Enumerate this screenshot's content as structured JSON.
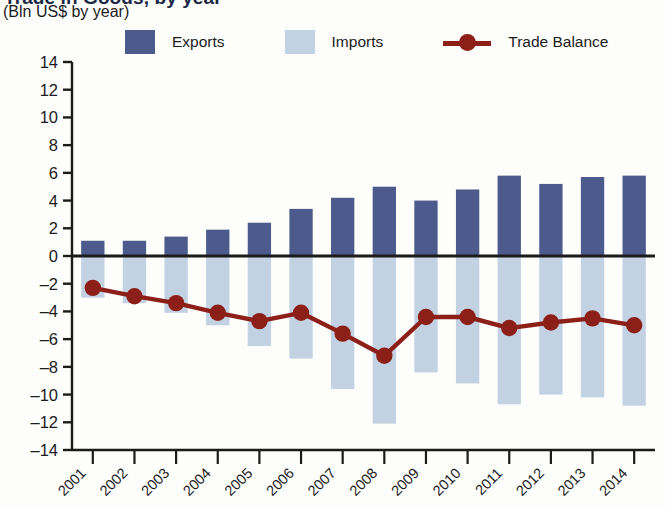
{
  "header": {
    "title": "Trade in Goods, by year",
    "subtitle": "(Bln US$ by year)"
  },
  "legend": {
    "items": [
      {
        "label": "Exports",
        "type": "swatch",
        "color": "#4c5b8c",
        "name": "legend-exports"
      },
      {
        "label": "Imports",
        "type": "swatch",
        "color": "#c3d2e3",
        "name": "legend-imports"
      },
      {
        "label": "Trade Balance",
        "type": "line",
        "color": "#8c1f17",
        "name": "legend-trade-balance"
      }
    ]
  },
  "axes": {
    "y_ticks": [
      "14",
      "12",
      "10",
      "8",
      "6",
      "4",
      "2",
      "0",
      "-2",
      "-4",
      "-6",
      "-8",
      "-10",
      "-12",
      "-14"
    ],
    "y_min": -14,
    "y_max": 14,
    "y_step": 2,
    "x_labels": [
      "2001",
      "2002",
      "2003",
      "2004",
      "2005",
      "2006",
      "2007",
      "2008",
      "2009",
      "2010",
      "2011",
      "2012",
      "2013",
      "2014"
    ]
  },
  "colors": {
    "exports": "#4c5b8c",
    "imports": "#c3d2e3",
    "trade_balance": "#8c1f17",
    "axis": "#1b1b1b"
  },
  "chart_data": {
    "type": "bar",
    "title": "Trade in Goods, by year",
    "subtitle": "(Bln US$ by year)",
    "xlabel": "",
    "ylabel": "Bln US$ by year",
    "ylim": [
      -14,
      14
    ],
    "grid": false,
    "legend_position": "top",
    "categories": [
      "2001",
      "2002",
      "2003",
      "2004",
      "2005",
      "2006",
      "2007",
      "2008",
      "2009",
      "2010",
      "2011",
      "2012",
      "2013",
      "2014"
    ],
    "series": [
      {
        "name": "Exports",
        "type": "bar",
        "color": "#4c5b8c",
        "values": [
          1.1,
          1.1,
          1.4,
          1.9,
          2.4,
          3.4,
          4.2,
          5.0,
          4.0,
          4.8,
          5.8,
          5.2,
          5.7,
          5.8
        ]
      },
      {
        "name": "Imports",
        "type": "bar",
        "color": "#c3d2e3",
        "values": [
          -3.0,
          -3.4,
          -4.1,
          -5.0,
          -6.5,
          -7.4,
          -9.6,
          -12.1,
          -8.4,
          -9.2,
          -10.7,
          -10.0,
          -10.2,
          -10.8
        ]
      },
      {
        "name": "Trade Balance",
        "type": "line",
        "color": "#8c1f17",
        "values": [
          -2.3,
          -2.9,
          -3.4,
          -4.1,
          -4.7,
          -4.1,
          -5.6,
          -7.2,
          -4.4,
          -4.4,
          -5.2,
          -4.8,
          -4.5,
          -5.0
        ]
      }
    ]
  }
}
